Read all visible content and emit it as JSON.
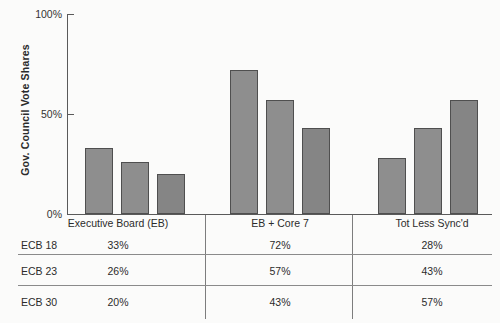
{
  "chart_data": {
    "type": "bar",
    "title": "",
    "xlabel": "",
    "ylabel": "Gov. Council  Vote Shares",
    "ylim": [
      0,
      100
    ],
    "yticks": [
      "0%",
      "50%",
      "100%"
    ],
    "grid": false,
    "legend_position": "none",
    "categories": [
      "Executive Board (EB)",
      "EB + Core 7",
      "Tot Less Sync'd"
    ],
    "series": [
      {
        "name": "ECB 18",
        "values": [
          33,
          26,
          20
        ]
      },
      {
        "name": "ECB 23",
        "values": [
          72,
          57,
          43
        ]
      },
      {
        "name": "ECB 30",
        "values": [
          28,
          43,
          57
        ]
      }
    ],
    "note": "Bars are grouped by column category; within each group the three bars correspond to table rows ECB 18, ECB 23, ECB 30.",
    "groups": [
      {
        "category": "Executive Board (EB)",
        "bars": [
          33,
          26,
          20
        ]
      },
      {
        "category": "EB + Core 7",
        "bars": [
          72,
          57,
          43
        ]
      },
      {
        "category": "Tot Less Sync'd",
        "bars": [
          28,
          43,
          57
        ]
      }
    ],
    "bar_color": "#8e8e8e",
    "bar_edge_color": "#4f4f4f"
  },
  "axis": {
    "y_title": "Gov. Council  Vote Shares",
    "ticks": [
      {
        "label": "100%",
        "value": 100
      },
      {
        "label": "50%",
        "value": 50
      },
      {
        "label": "0%",
        "value": 0
      }
    ]
  },
  "table": {
    "column_headers": [
      "Executive Board (EB)",
      "EB + Core 7",
      "Tot Less Sync'd"
    ],
    "rows": [
      {
        "label": "ECB 18",
        "values": [
          "33%",
          "72%",
          "28%"
        ]
      },
      {
        "label": "ECB 23",
        "values": [
          "26%",
          "57%",
          "43%"
        ]
      },
      {
        "label": "ECB 30",
        "values": [
          "20%",
          "43%",
          "57%"
        ]
      }
    ]
  }
}
